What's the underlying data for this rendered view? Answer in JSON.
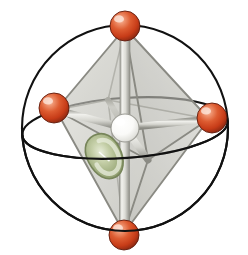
{
  "figure": {
    "title": "Octahedral coordination complex with d-orbital lobe",
    "caption": "",
    "background_color": "#ffffff",
    "width": 248,
    "height": 255
  },
  "colors": {
    "ligand_red_light": "#e8805c",
    "ligand_red": "#d2401c",
    "ligand_red_dark": "#8e2a12",
    "ligand_highlight": "#f7c2ad",
    "center_white": "#ffffff",
    "center_shade": "#d8d8d4",
    "center_outline": "#8c8c88",
    "orbital_green": "#9aa878",
    "orbital_green_light": "#d7dec4",
    "orbital_green_dark": "#6f7c52",
    "octahedron_face": "#c9c9c2",
    "edge_gray": "#8f8f88",
    "rod_light": "#f0f0ec",
    "rod_gray": "#a8a8a2",
    "sphere_outline": "#000000"
  },
  "sphere_cage": {
    "outline_label": "circumscribing sphere outline",
    "equator_label": "equatorial great circle",
    "center": {
      "cx": 125,
      "cy": 128
    },
    "radius": 103,
    "equator_rx": 103,
    "equator_ry": 30,
    "equator_tilt_deg": -4,
    "stroke": "#111111",
    "stroke_width": 2.1
  },
  "central_atom": {
    "label": "central metal atom",
    "cx": 125,
    "cy": 128,
    "r": 14,
    "fill": "#ffffff"
  },
  "orbital_lobe": {
    "label": "d-orbital lobe",
    "cx": 104,
    "cy": 155,
    "rx": 17,
    "ry": 22,
    "rotation_deg": -28,
    "fill": "#9aa878"
  },
  "ligands": [
    {
      "name": "ligand-top",
      "cx": 125,
      "cy": 26,
      "r": 15
    },
    {
      "name": "ligand-bottom",
      "cx": 124,
      "cy": 235,
      "r": 15
    },
    {
      "name": "ligand-left",
      "cx": 54,
      "cy": 108,
      "r": 15
    },
    {
      "name": "ligand-right",
      "cx": 212,
      "cy": 118,
      "r": 15
    },
    {
      "name": "ligand-front",
      "cx": 125,
      "cy": 128,
      "r": 0
    },
    {
      "name": "ligand-back",
      "cx": 125,
      "cy": 128,
      "r": 0
    }
  ],
  "octahedron": {
    "label": "octahedron coordination polyhedron",
    "vertices": {
      "top": {
        "x": 125,
        "y": 28
      },
      "bottom": {
        "x": 124,
        "y": 233
      },
      "left": {
        "x": 56,
        "y": 110
      },
      "right": {
        "x": 209,
        "y": 119
      },
      "front": {
        "x": 148,
        "y": 160
      },
      "back": {
        "x": 108,
        "y": 100
      }
    },
    "face_opacity": 0.42,
    "edge_color": "#8f8f88"
  },
  "bonds": [
    {
      "name": "bond-center-top",
      "from": "center",
      "to": "top"
    },
    {
      "name": "bond-center-bottom",
      "from": "center",
      "to": "bottom"
    },
    {
      "name": "bond-center-left",
      "from": "center",
      "to": "left"
    },
    {
      "name": "bond-center-right",
      "from": "center",
      "to": "right"
    },
    {
      "name": "bond-center-front",
      "from": "center",
      "to": "front"
    },
    {
      "name": "bond-center-back",
      "from": "center",
      "to": "back"
    }
  ]
}
